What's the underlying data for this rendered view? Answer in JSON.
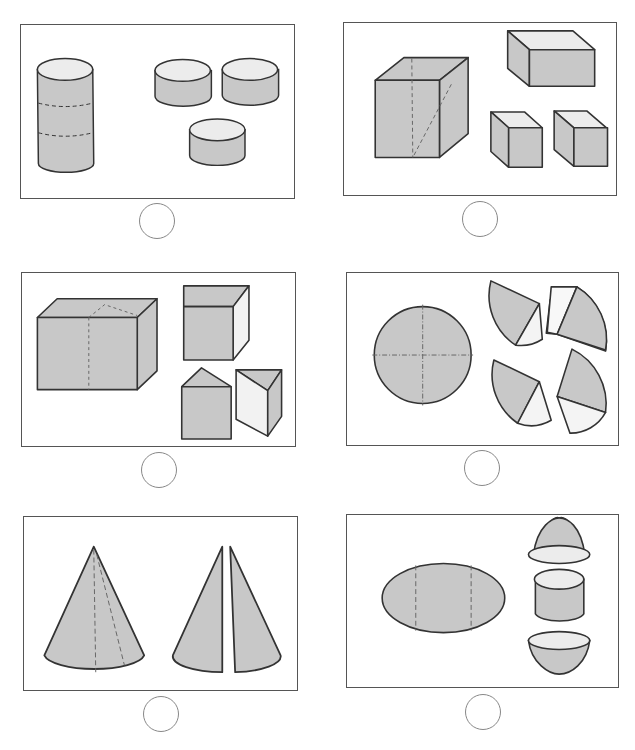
{
  "worksheet": {
    "colors": {
      "fill": "#c8c8c8",
      "light": "#ececec",
      "stroke": "#333333",
      "border": "#555555",
      "circle": "#888888"
    },
    "panels": [
      {
        "id": 1,
        "whole": "tall cylinder with two dashed cut lines",
        "parts": [
          "short cylinder",
          "short cylinder",
          "short cylinder"
        ],
        "answer": ""
      },
      {
        "id": 2,
        "whole": "cube with dashed diagonal cut",
        "parts": [
          "rectangular box",
          "small box",
          "small box"
        ],
        "answer": ""
      },
      {
        "id": 3,
        "whole": "rectangular prism with dashed cut lines",
        "parts": [
          "cube",
          "pentagonal prism",
          "triangular prism"
        ],
        "answer": ""
      },
      {
        "id": 4,
        "whole": "circle with dash-dot cross lines",
        "parts": [
          "circle sector",
          "circle sector",
          "circle sector",
          "circle sector"
        ],
        "answer": ""
      },
      {
        "id": 5,
        "whole": "cone with dashed cut lines",
        "parts": [
          "half cone",
          "half cone"
        ],
        "answer": ""
      },
      {
        "id": 6,
        "whole": "ellipsoid with two dashed cut lines",
        "parts": [
          "dome cap",
          "cylinder",
          "bowl cap"
        ],
        "answer": ""
      }
    ]
  }
}
